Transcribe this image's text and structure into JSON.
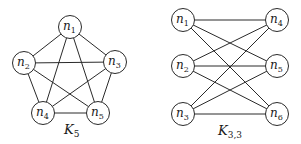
{
  "graphs": [
    {
      "id": "k5",
      "title": "K",
      "title_sub": "5",
      "title_pos": [
        64,
        134
      ],
      "node_radius": 11.5,
      "nodes": [
        {
          "id": "n1",
          "label": "n",
          "sub": "1",
          "x": 70,
          "y": 27
        },
        {
          "id": "n2",
          "label": "n",
          "sub": "2",
          "x": 24,
          "y": 63
        },
        {
          "id": "n3",
          "label": "n",
          "sub": "3",
          "x": 115,
          "y": 62
        },
        {
          "id": "n4",
          "label": "n",
          "sub": "4",
          "x": 43,
          "y": 113
        },
        {
          "id": "n5",
          "label": "n",
          "sub": "5",
          "x": 98,
          "y": 113
        }
      ],
      "edges": [
        [
          "n1",
          "n2"
        ],
        [
          "n1",
          "n3"
        ],
        [
          "n1",
          "n4"
        ],
        [
          "n1",
          "n5"
        ],
        [
          "n2",
          "n3"
        ],
        [
          "n2",
          "n4"
        ],
        [
          "n2",
          "n5"
        ],
        [
          "n3",
          "n4"
        ],
        [
          "n3",
          "n5"
        ],
        [
          "n4",
          "n5"
        ]
      ]
    },
    {
      "id": "k33",
      "title": "K",
      "title_sub": "3,3",
      "title_pos": [
        218,
        135
      ],
      "node_radius": 11.5,
      "nodes": [
        {
          "id": "n1",
          "label": "n",
          "sub": "1",
          "x": 183,
          "y": 20
        },
        {
          "id": "n2",
          "label": "n",
          "sub": "2",
          "x": 183,
          "y": 66
        },
        {
          "id": "n3",
          "label": "n",
          "sub": "3",
          "x": 183,
          "y": 114
        },
        {
          "id": "n4",
          "label": "n",
          "sub": "4",
          "x": 277,
          "y": 20
        },
        {
          "id": "n5",
          "label": "n",
          "sub": "5",
          "x": 277,
          "y": 66
        },
        {
          "id": "n6",
          "label": "n",
          "sub": "6",
          "x": 277,
          "y": 114
        }
      ],
      "edges": [
        [
          "n1",
          "n4"
        ],
        [
          "n1",
          "n5"
        ],
        [
          "n1",
          "n6"
        ],
        [
          "n2",
          "n4"
        ],
        [
          "n2",
          "n5"
        ],
        [
          "n2",
          "n6"
        ],
        [
          "n3",
          "n4"
        ],
        [
          "n3",
          "n5"
        ],
        [
          "n3",
          "n6"
        ]
      ]
    }
  ]
}
